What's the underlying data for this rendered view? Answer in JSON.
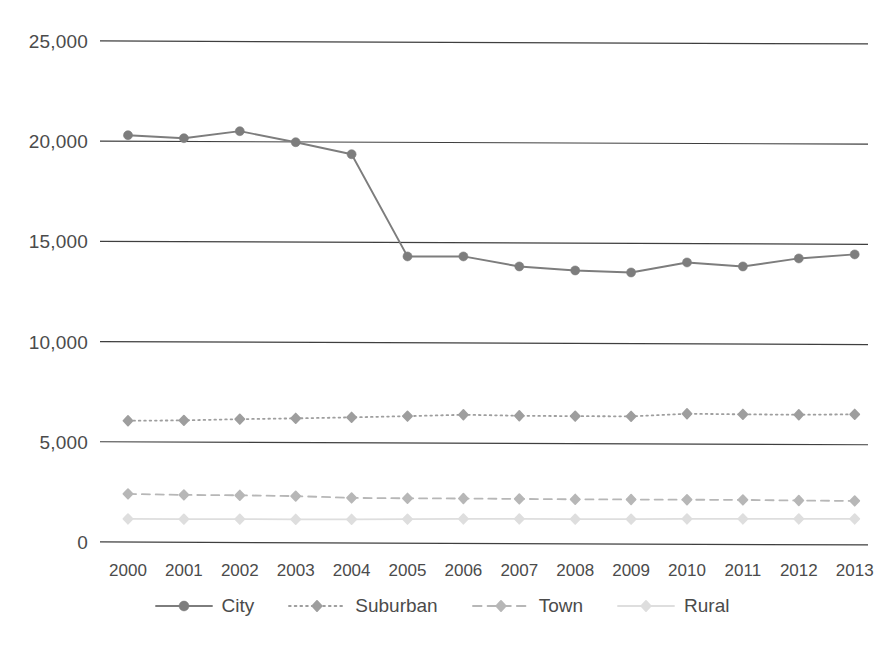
{
  "chart_data": {
    "type": "line",
    "title": "",
    "subtitle": "",
    "xlabel": "",
    "ylabel": "",
    "categories": [
      "2000",
      "2001",
      "2002",
      "2003",
      "2004",
      "2005",
      "2006",
      "2007",
      "2008",
      "2009",
      "2010",
      "2011",
      "2012",
      "2013"
    ],
    "ylim": [
      0,
      25000
    ],
    "yticks": [
      0,
      5000,
      10000,
      15000,
      20000,
      25000
    ],
    "ytick_labels": [
      "0",
      "5,000",
      "10,000",
      "15,000",
      "20,000",
      "25,000"
    ],
    "grid": true,
    "grid_axis": "y",
    "legend_position": "bottom",
    "series": [
      {
        "name": "City",
        "color": "#7d7d7d",
        "line_style": "solid",
        "marker": "circle",
        "marker_size": 9,
        "values": [
          20350,
          20200,
          20550,
          20000,
          19400,
          14300,
          14300,
          13800,
          13600,
          13500,
          14000,
          13800,
          14200,
          14400
        ]
      },
      {
        "name": "Suburban",
        "color": "#9e9e9e",
        "line_style": "dotted",
        "marker": "diamond",
        "marker_size": 8,
        "values": [
          6100,
          6120,
          6180,
          6220,
          6270,
          6330,
          6400,
          6350,
          6330,
          6320,
          6450,
          6420,
          6400,
          6420
        ]
      },
      {
        "name": "Town",
        "color": "#b7b7b7",
        "line_style": "dashed",
        "marker": "diamond",
        "marker_size": 8,
        "values": [
          2450,
          2400,
          2380,
          2340,
          2250,
          2230,
          2220,
          2200,
          2180,
          2170,
          2160,
          2150,
          2120,
          2100
        ]
      },
      {
        "name": "Rural",
        "color": "#dedede",
        "line_style": "solid",
        "marker": "diamond",
        "marker_size": 8,
        "values": [
          1200,
          1190,
          1190,
          1180,
          1180,
          1190,
          1200,
          1200,
          1190,
          1190,
          1200,
          1200,
          1200,
          1200
        ]
      }
    ]
  },
  "axes": {
    "gridline_color": "#3f3f3f",
    "gridline_width": 1.2
  },
  "legend": {
    "items": [
      {
        "label": "City"
      },
      {
        "label": "Suburban"
      },
      {
        "label": "Town"
      },
      {
        "label": "Rural"
      }
    ]
  }
}
